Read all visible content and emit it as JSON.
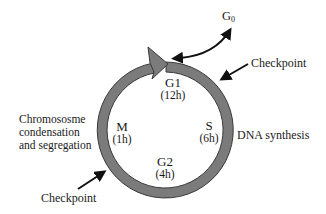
{
  "diagram": {
    "colors": {
      "ring_fill": "#7b7b7b",
      "ring_stroke": "#3a3a3a",
      "arrow": "#111111",
      "text": "#1a1a1a",
      "background": "#ffffff"
    },
    "phases": [
      {
        "name": "G1",
        "duration": "(12h)"
      },
      {
        "name": "S",
        "duration": "(6h)"
      },
      {
        "name": "G2",
        "duration": "(4h)"
      },
      {
        "name": "M",
        "duration": "(1h)"
      }
    ],
    "g0": {
      "base": "G",
      "sub": "0"
    },
    "annotations": {
      "s_phase": "DNA synthesis",
      "m_phase": [
        "Chromososme",
        "condensation",
        "and segregation"
      ],
      "checkpoint_top": "Checkpoint",
      "checkpoint_bottom": "Checkpoint"
    }
  }
}
